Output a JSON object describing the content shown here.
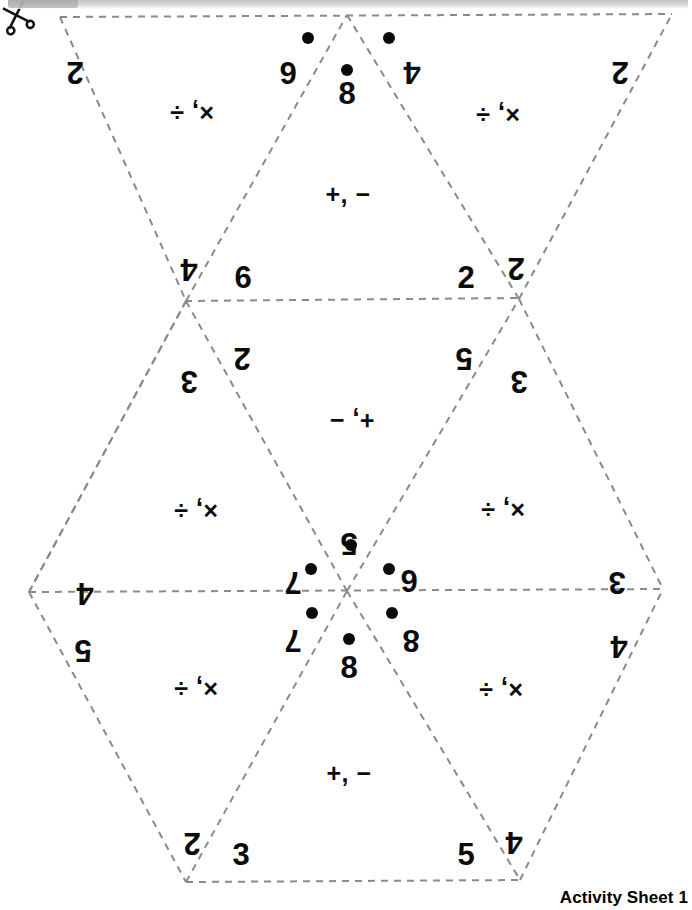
{
  "document": {
    "title": "Activity Sheet 1",
    "type": "foldable-hexahexaflexagon-template",
    "footer_label": "Activity Sheet 1"
  },
  "icons": {
    "scissors": "scissors-icon",
    "cut_line": "cut-dashed-line"
  },
  "colors": {
    "ink": "#0b0b0b",
    "fold_line": "#8a8a8a",
    "paper": "#ffffff",
    "scan_bar": "#b9b9b9"
  },
  "triangles": [
    {
      "id": "t1-top-left-down",
      "orientation": "down",
      "operators": "×, ÷",
      "operator_rotation": 180,
      "corners": [
        {
          "value": "2",
          "rotation": 180,
          "dots": 0
        },
        {
          "value": "6",
          "rotation": 180,
          "dots": 1
        },
        {
          "value": "4",
          "rotation": 180,
          "dots": 0
        }
      ]
    },
    {
      "id": "t2-top-center-up",
      "orientation": "up",
      "operators": "+, −",
      "operator_rotation": 0,
      "corners": [
        {
          "value": "8",
          "rotation": 0,
          "dots": 1
        },
        {
          "value": "6",
          "rotation": 0,
          "dots": 0
        },
        {
          "value": "2",
          "rotation": 0,
          "dots": 0
        }
      ]
    },
    {
      "id": "t3-top-right-down",
      "orientation": "down",
      "operators": "×, ÷",
      "operator_rotation": 180,
      "corners": [
        {
          "value": "4",
          "rotation": 180,
          "dots": 1
        },
        {
          "value": "2",
          "rotation": 180,
          "dots": 0
        },
        {
          "value": "2",
          "rotation": 180,
          "dots": 0
        }
      ]
    },
    {
      "id": "t4-mid-left-up",
      "orientation": "up",
      "operators": "×, ÷",
      "operator_rotation": 180,
      "corners": [
        {
          "value": "3",
          "rotation": 180,
          "dots": 0
        },
        {
          "value": "4",
          "rotation": 180,
          "dots": 0
        },
        {
          "value": "7",
          "rotation": 180,
          "dots": 1
        }
      ]
    },
    {
      "id": "t5-mid-center-down",
      "orientation": "down",
      "operators": "+, −",
      "operator_rotation": 180,
      "corners": [
        {
          "value": "2",
          "rotation": 180,
          "dots": 0
        },
        {
          "value": "3",
          "rotation": 180,
          "dots": 0
        },
        {
          "value": "5",
          "rotation": 180,
          "dots": 1
        }
      ]
    },
    {
      "id": "t6-mid-right-up",
      "orientation": "up",
      "operators": "×, ÷",
      "operator_rotation": 180,
      "corners": [
        {
          "value": "3",
          "rotation": 180,
          "dots": 0
        },
        {
          "value": "6",
          "rotation": 180,
          "dots": 1
        },
        {
          "value": "3",
          "rotation": 180,
          "dots": 0
        }
      ]
    },
    {
      "id": "t7-bot-left-down",
      "orientation": "down",
      "operators": "×, ÷",
      "operator_rotation": 180,
      "corners": [
        {
          "value": "5",
          "rotation": 180,
          "dots": 0
        },
        {
          "value": "7",
          "rotation": 180,
          "dots": 1
        },
        {
          "value": "2",
          "rotation": 180,
          "dots": 0
        }
      ]
    },
    {
      "id": "t8-bot-center-up",
      "orientation": "up",
      "operators": "+, −",
      "operator_rotation": 0,
      "corners": [
        {
          "value": "8",
          "rotation": 0,
          "dots": 1
        },
        {
          "value": "3",
          "rotation": 0,
          "dots": 0
        },
        {
          "value": "5",
          "rotation": 0,
          "dots": 0
        }
      ]
    },
    {
      "id": "t9-bot-right-down",
      "orientation": "down",
      "operators": "×, ÷",
      "operator_rotation": 180,
      "corners": [
        {
          "value": "8",
          "rotation": 180,
          "dots": 1
        },
        {
          "value": "4",
          "rotation": 180,
          "dots": 0
        },
        {
          "value": "4",
          "rotation": 180,
          "dots": 0
        }
      ]
    }
  ],
  "glyphs": {
    "plus_minus": "+, −",
    "times_divide": "×, ÷"
  },
  "edge_numbers": {
    "left_upper": "4",
    "left_lower": "5",
    "right_upper": "3",
    "right_lower": "4"
  }
}
